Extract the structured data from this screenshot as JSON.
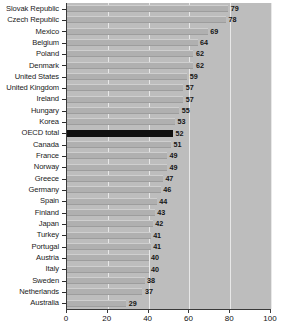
{
  "chart_data": {
    "type": "bar",
    "orientation": "horizontal",
    "title": "",
    "subtitle": "",
    "xlabel": "",
    "ylabel": "",
    "xlim": [
      0,
      100
    ],
    "xticks": [
      0,
      20,
      40,
      60,
      80,
      100
    ],
    "grid": true,
    "legend": null,
    "highlight_category": "OECD total",
    "highlight_color": "#101010",
    "bar_color": "#b0b0b0",
    "plot_background": "#bdbdbd",
    "categories": [
      "Slovak Republic",
      "Czech Republic",
      "Mexico",
      "Belgium",
      "Poland",
      "Denmark",
      "United States",
      "United Kingdom",
      "Ireland",
      "Hungary",
      "Korea",
      "OECD total",
      "Canada",
      "France",
      "Norway",
      "Greece",
      "Germany",
      "Spain",
      "Finland",
      "Japan",
      "Turkey",
      "Portugal",
      "Austria",
      "Italy",
      "Sweden",
      "Netherlands",
      "Australia"
    ],
    "values": [
      79,
      78,
      69,
      64,
      62,
      62,
      59,
      57,
      57,
      55,
      53,
      52,
      51,
      49,
      49,
      47,
      46,
      44,
      43,
      42,
      41,
      41,
      40,
      40,
      38,
      37,
      29
    ]
  }
}
